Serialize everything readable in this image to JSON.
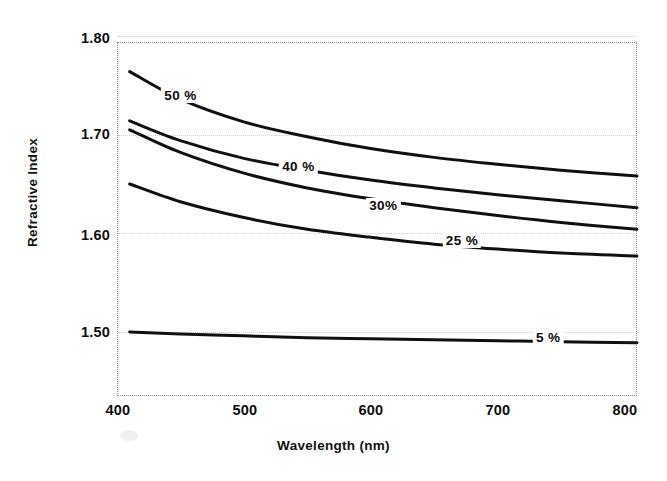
{
  "chart_data": {
    "type": "line",
    "title": "",
    "xlabel": "Wavelength (nm)",
    "ylabel": "Refractive Index",
    "xlim": [
      400,
      810
    ],
    "ylim": [
      1.435,
      1.794
    ],
    "xticks": [
      400,
      500,
      600,
      700,
      800
    ],
    "xtick_labels": [
      "400",
      "500",
      "600",
      "700",
      "800"
    ],
    "yticks": [
      1.5,
      1.6,
      1.7,
      1.8
    ],
    "ytick_labels": [
      "1.50",
      "1.60",
      "1.70",
      "1.80"
    ],
    "grid": "horizontal-dotted",
    "legend_position": "inline-annotations",
    "x": [
      410,
      450,
      500,
      550,
      600,
      650,
      700,
      750,
      810
    ],
    "series": [
      {
        "name": "50 %",
        "label": "50 %",
        "values": [
          1.764,
          1.736,
          1.713,
          1.698,
          1.686,
          1.677,
          1.67,
          1.664,
          1.658
        ]
      },
      {
        "name": "40 %",
        "label": "40 %",
        "values": [
          1.714,
          1.694,
          1.676,
          1.664,
          1.654,
          1.646,
          1.639,
          1.633,
          1.626
        ]
      },
      {
        "name": "30 %",
        "label": "30%",
        "values": [
          1.705,
          1.682,
          1.661,
          1.646,
          1.635,
          1.626,
          1.618,
          1.611,
          1.604
        ]
      },
      {
        "name": "25 %",
        "label": "25 %",
        "values": [
          1.65,
          1.632,
          1.616,
          1.604,
          1.596,
          1.589,
          1.584,
          1.58,
          1.577
        ]
      },
      {
        "name": "5 %",
        "label": "5 %",
        "values": [
          1.5,
          1.498,
          1.496,
          1.494,
          1.493,
          1.492,
          1.491,
          1.49,
          1.489
        ]
      }
    ],
    "annotations": [
      {
        "text": "50 %",
        "x": 450,
        "y": 1.738
      },
      {
        "text": "40 %",
        "x": 543,
        "y": 1.666
      },
      {
        "text": "30%",
        "x": 610,
        "y": 1.627
      },
      {
        "text": "25 %",
        "x": 672,
        "y": 1.591
      },
      {
        "text": "5 %",
        "x": 740,
        "y": 1.493
      }
    ]
  }
}
